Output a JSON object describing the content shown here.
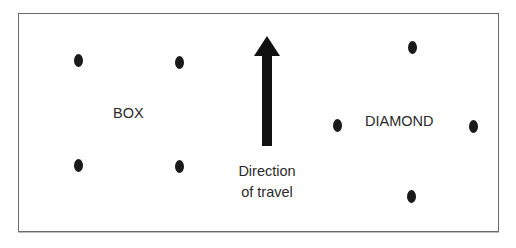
{
  "diagram": {
    "formations": [
      {
        "label": "BOX",
        "points": [
          [
            78,
            60
          ],
          [
            179,
            62
          ],
          [
            78,
            165
          ],
          [
            179,
            166
          ]
        ]
      },
      {
        "label": "DIAMOND",
        "points": [
          [
            412,
            47
          ],
          [
            337,
            125
          ],
          [
            473,
            126
          ],
          [
            411,
            196
          ]
        ]
      }
    ],
    "arrow": {
      "direction": "up",
      "caption_line1": "Direction",
      "caption_line2": "of travel"
    },
    "colors": {
      "dot": "#1a1a1a",
      "arrow": "#111111",
      "text": "#2b2b2b",
      "border": "#6a6a6a"
    }
  }
}
